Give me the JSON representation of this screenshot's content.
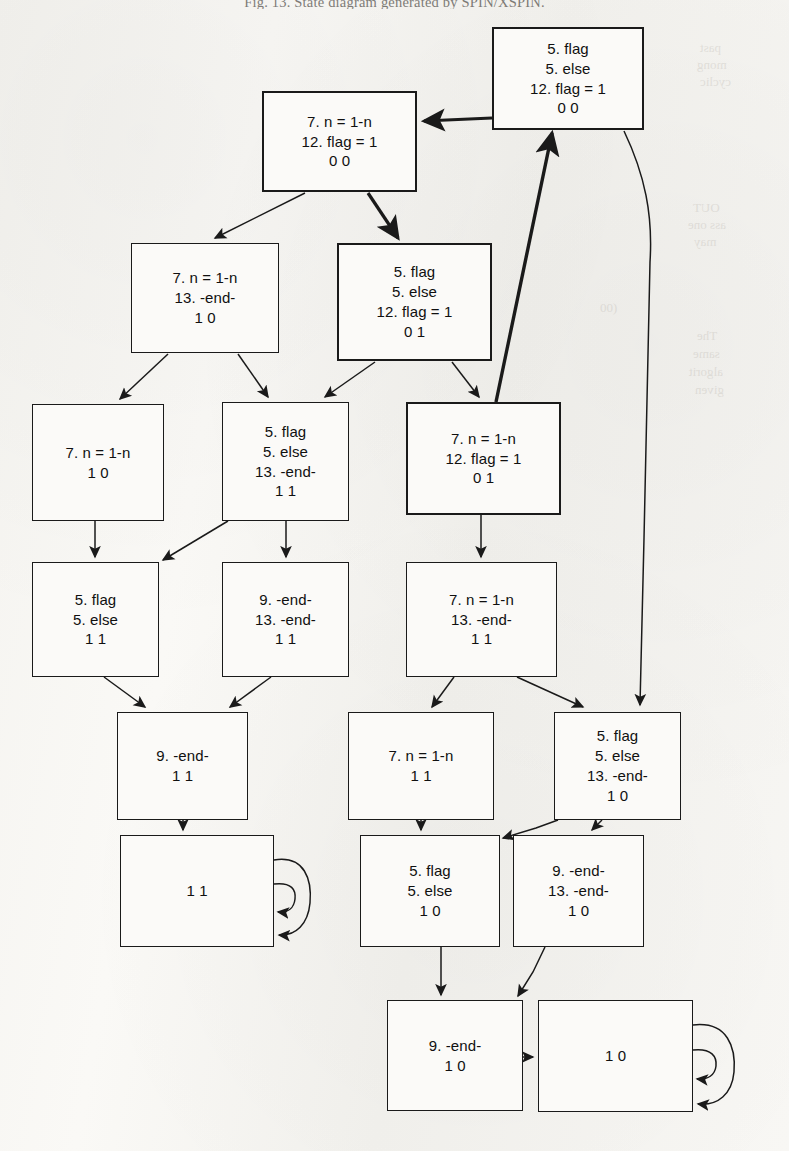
{
  "caption": "Fig. 13. State diagram generated by SPIN/XSPIN.",
  "bleed_through": [
    {
      "text": "past",
      "x": 700,
      "y": 40
    },
    {
      "text": "mong",
      "x": 697,
      "y": 57
    },
    {
      "text": "cyclic",
      "x": 700,
      "y": 74
    },
    {
      "text": "OUT",
      "x": 693,
      "y": 200
    },
    {
      "text": "ass one",
      "x": 688,
      "y": 217
    },
    {
      "text": "may",
      "x": 694,
      "y": 234
    },
    {
      "text": "(00",
      "x": 600,
      "y": 300
    },
    {
      "text": "The",
      "x": 697,
      "y": 328
    },
    {
      "text": "same",
      "x": 693,
      "y": 346
    },
    {
      "text": "algorit",
      "x": 689,
      "y": 364
    },
    {
      "text": "given",
      "x": 695,
      "y": 382
    }
  ],
  "diagram": {
    "type": "state-diagram",
    "background": "#f7f6f3",
    "stroke": "#1a1a1a",
    "nodes": [
      {
        "id": "n0",
        "name": "state-node-5flag-5else-12flag1-00",
        "x": 492,
        "y": 27,
        "w": 152,
        "h": 103,
        "bold": true,
        "lines": [
          "5. flag",
          "5. else",
          "12. flag = 1",
          "0 0"
        ]
      },
      {
        "id": "n1",
        "name": "state-node-7n1n-12flag1-00",
        "x": 262,
        "y": 91,
        "w": 155,
        "h": 101,
        "bold": true,
        "lines": [
          "7. n = 1-n",
          "12. flag = 1",
          "0 0"
        ]
      },
      {
        "id": "n2",
        "name": "state-node-7n1n-13end-10",
        "x": 131,
        "y": 243,
        "w": 148,
        "h": 110,
        "bold": false,
        "lines": [
          "7. n = 1-n",
          "13. -end-",
          "1 0"
        ]
      },
      {
        "id": "n3",
        "name": "state-node-5flag-5else-12flag1-01",
        "x": 337,
        "y": 243,
        "w": 155,
        "h": 118,
        "bold": true,
        "lines": [
          "5. flag",
          "5. else",
          "12. flag = 1",
          "0 1"
        ]
      },
      {
        "id": "n4",
        "name": "state-node-7n1n-10",
        "x": 32,
        "y": 404,
        "w": 132,
        "h": 117,
        "bold": false,
        "lines": [
          "7. n = 1-n",
          "1 0"
        ]
      },
      {
        "id": "n5",
        "name": "state-node-5flag-5else-13end-11",
        "x": 222,
        "y": 402,
        "w": 127,
        "h": 119,
        "bold": false,
        "lines": [
          "5. flag",
          "5. else",
          "13. -end-",
          "1 1"
        ]
      },
      {
        "id": "n6",
        "name": "state-node-7n1n-12flag1-01",
        "x": 406,
        "y": 402,
        "w": 155,
        "h": 113,
        "bold": true,
        "lines": [
          "7. n = 1-n",
          "12. flag = 1",
          "0 1"
        ]
      },
      {
        "id": "n7",
        "name": "state-node-5flag-5else-11",
        "x": 32,
        "y": 562,
        "w": 127,
        "h": 115,
        "bold": false,
        "lines": [
          "5. flag",
          "5. else",
          "1 1"
        ]
      },
      {
        "id": "n8",
        "name": "state-node-9end-13end-11",
        "x": 222,
        "y": 562,
        "w": 127,
        "h": 115,
        "bold": false,
        "lines": [
          "9. -end-",
          "13. -end-",
          "1 1"
        ]
      },
      {
        "id": "n9",
        "name": "state-node-7n1n-13end-11",
        "x": 406,
        "y": 562,
        "w": 151,
        "h": 115,
        "bold": false,
        "lines": [
          "7. n = 1-n",
          "13. -end-",
          "1 1"
        ]
      },
      {
        "id": "n10",
        "name": "state-node-9end-11",
        "x": 117,
        "y": 712,
        "w": 131,
        "h": 108,
        "bold": false,
        "lines": [
          "9. -end-",
          "1 1"
        ]
      },
      {
        "id": "n11",
        "name": "state-node-7n1n-11",
        "x": 348,
        "y": 712,
        "w": 146,
        "h": 108,
        "bold": false,
        "lines": [
          "7. n = 1-n",
          "1 1"
        ]
      },
      {
        "id": "n12",
        "name": "state-node-5flag-5else-13end-10",
        "x": 554,
        "y": 712,
        "w": 127,
        "h": 108,
        "bold": false,
        "lines": [
          "5. flag",
          "5. else",
          "13. -end-",
          "1 0"
        ]
      },
      {
        "id": "n13",
        "name": "accept-node-11",
        "x": 120,
        "y": 835,
        "w": 154,
        "h": 112,
        "bold": false,
        "lines": [
          "1 1"
        ],
        "self_loop": true
      },
      {
        "id": "n14",
        "name": "state-node-5flag-5else-10",
        "x": 360,
        "y": 835,
        "w": 140,
        "h": 112,
        "bold": false,
        "lines": [
          "5. flag",
          "5. else",
          "1 0"
        ]
      },
      {
        "id": "n15",
        "name": "state-node-9end-13end-10",
        "x": 513,
        "y": 835,
        "w": 131,
        "h": 112,
        "bold": false,
        "lines": [
          "9. -end-",
          "13. -end-",
          "1 0"
        ]
      },
      {
        "id": "n16",
        "name": "state-node-9end-10",
        "x": 387,
        "y": 1000,
        "w": 136,
        "h": 111,
        "bold": false,
        "lines": [
          "9. -end-",
          "1 0"
        ]
      },
      {
        "id": "n17",
        "name": "accept-node-10",
        "x": 538,
        "y": 1000,
        "w": 155,
        "h": 112,
        "bold": false,
        "lines": [
          "1 0"
        ],
        "self_loop": true
      }
    ],
    "edges": [
      {
        "name": "edge-n0-n1",
        "from": "n0",
        "to": "n1",
        "style": "thick"
      },
      {
        "name": "edge-n1-n2",
        "from": "n1",
        "to": "n2",
        "style": "thin"
      },
      {
        "name": "edge-n1-n3",
        "from": "n1",
        "to": "n3",
        "style": "thick"
      },
      {
        "name": "edge-n0-n12",
        "from": "n0",
        "to": "n12",
        "style": "thin"
      },
      {
        "name": "edge-n6-n0",
        "from": "n6",
        "to": "n0",
        "style": "thick"
      },
      {
        "name": "edge-n2-n4",
        "from": "n2",
        "to": "n4",
        "style": "thin"
      },
      {
        "name": "edge-n2-n5",
        "from": "n2",
        "to": "n5",
        "style": "thin"
      },
      {
        "name": "edge-n3-n5",
        "from": "n3",
        "to": "n5",
        "style": "thin"
      },
      {
        "name": "edge-n3-n6",
        "from": "n3",
        "to": "n6",
        "style": "thin"
      },
      {
        "name": "edge-n4-n7",
        "from": "n4",
        "to": "n7",
        "style": "thin"
      },
      {
        "name": "edge-n5-n7",
        "from": "n5",
        "to": "n7",
        "style": "thin"
      },
      {
        "name": "edge-n5-n8",
        "from": "n5",
        "to": "n8",
        "style": "thin"
      },
      {
        "name": "edge-n6-n9",
        "from": "n6",
        "to": "n9",
        "style": "thin"
      },
      {
        "name": "edge-n7-n10",
        "from": "n7",
        "to": "n10",
        "style": "thin"
      },
      {
        "name": "edge-n8-n10",
        "from": "n8",
        "to": "n10",
        "style": "thin"
      },
      {
        "name": "edge-n9-n11",
        "from": "n9",
        "to": "n11",
        "style": "thin"
      },
      {
        "name": "edge-n9-n12",
        "from": "n9",
        "to": "n12",
        "style": "thin"
      },
      {
        "name": "edge-n10-n13",
        "from": "n10",
        "to": "n13",
        "style": "thin"
      },
      {
        "name": "edge-n11-n14",
        "from": "n11",
        "to": "n14",
        "style": "thin"
      },
      {
        "name": "edge-n12-n14",
        "from": "n12",
        "to": "n14",
        "style": "thin"
      },
      {
        "name": "edge-n12-n15",
        "from": "n12",
        "to": "n15",
        "style": "thin"
      },
      {
        "name": "edge-n14-n16",
        "from": "n14",
        "to": "n16",
        "style": "thin"
      },
      {
        "name": "edge-n15-n16",
        "from": "n15",
        "to": "n16",
        "style": "thin"
      },
      {
        "name": "edge-n16-n17",
        "from": "n16",
        "to": "n17",
        "style": "thin"
      },
      {
        "name": "edge-n13-self",
        "from": "n13",
        "to": "n13",
        "style": "self"
      },
      {
        "name": "edge-n17-self",
        "from": "n17",
        "to": "n17",
        "style": "self"
      }
    ]
  }
}
